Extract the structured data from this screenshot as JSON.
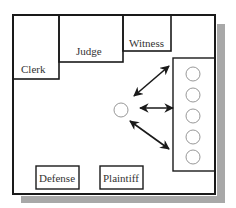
{
  "diagram": {
    "type": "courtroom-floor-plan",
    "colors": {
      "outline": "#1a1a1a",
      "shadow": "#a8a8a8",
      "seat": "#8c8c8c",
      "arrow": "#1a1a1a",
      "text": "#333333"
    },
    "areas": {
      "clerk": {
        "label": "Clerk"
      },
      "judge": {
        "label": "Judge"
      },
      "witness": {
        "label": "Witness"
      },
      "defense": {
        "label": "Defense"
      },
      "plaintiff": {
        "label": "Plaintiff"
      },
      "jury_box": {
        "label": "",
        "seats": 5
      }
    },
    "speaker": {
      "shape": "circle"
    },
    "arrows": [
      {
        "from": "speaker",
        "to": "jury-upper",
        "direction": "bidirectional"
      },
      {
        "from": "speaker",
        "to": "jury-middle",
        "direction": "bidirectional"
      },
      {
        "from": "speaker",
        "to": "jury-lower",
        "direction": "bidirectional"
      }
    ]
  }
}
